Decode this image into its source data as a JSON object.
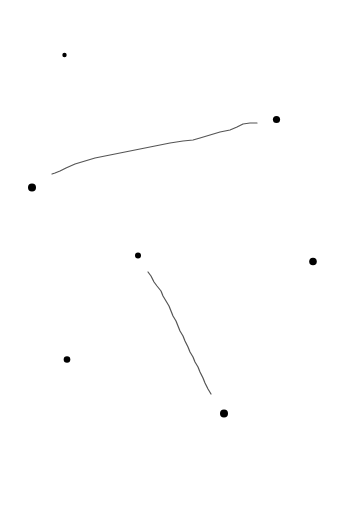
{
  "canvas": {
    "width": 337,
    "height": 524,
    "background": "#ffffff"
  },
  "points": [
    {
      "id": "dot-1",
      "x": 64.5,
      "y": 55,
      "r": 2.2,
      "color": "#000000"
    },
    {
      "id": "dot-2",
      "x": 276.5,
      "y": 119.5,
      "r": 3.6,
      "color": "#000000"
    },
    {
      "id": "dot-3",
      "x": 32,
      "y": 187.5,
      "r": 4.0,
      "color": "#000000"
    },
    {
      "id": "dot-4",
      "x": 138,
      "y": 255.5,
      "r": 3.0,
      "color": "#000000"
    },
    {
      "id": "dot-5",
      "x": 313,
      "y": 261.5,
      "r": 3.8,
      "color": "#000000"
    },
    {
      "id": "dot-6",
      "x": 67,
      "y": 359.5,
      "r": 3.3,
      "color": "#000000"
    },
    {
      "id": "dot-7",
      "x": 224,
      "y": 413.5,
      "r": 4.0,
      "color": "#000000"
    }
  ],
  "strokes": [
    {
      "id": "stroke-1",
      "color": "#555555",
      "width": 1.2,
      "points": [
        [
          52,
          174
        ],
        [
          55,
          173
        ],
        [
          60,
          171
        ],
        [
          66,
          168
        ],
        [
          75,
          164
        ],
        [
          85,
          161
        ],
        [
          95,
          158
        ],
        [
          110,
          155
        ],
        [
          125,
          152
        ],
        [
          140,
          149
        ],
        [
          155,
          146
        ],
        [
          170,
          143
        ],
        [
          183,
          141
        ],
        [
          193,
          140
        ],
        [
          200,
          138
        ],
        [
          210,
          135
        ],
        [
          220,
          132
        ],
        [
          230,
          130
        ],
        [
          237,
          127
        ],
        [
          243,
          124
        ],
        [
          250,
          123
        ],
        [
          257,
          123
        ]
      ]
    },
    {
      "id": "stroke-2",
      "color": "#555555",
      "width": 1.2,
      "points": [
        [
          148,
          272
        ],
        [
          151,
          276
        ],
        [
          154,
          282
        ],
        [
          157,
          286
        ],
        [
          161,
          291
        ],
        [
          163,
          296
        ],
        [
          166,
          301
        ],
        [
          169,
          306
        ],
        [
          171,
          311
        ],
        [
          173,
          316
        ],
        [
          176,
          321
        ],
        [
          178,
          326
        ],
        [
          180,
          331
        ],
        [
          183,
          336
        ],
        [
          185,
          341
        ],
        [
          188,
          347
        ],
        [
          190,
          352
        ],
        [
          193,
          357
        ],
        [
          195,
          362
        ],
        [
          198,
          367
        ],
        [
          200,
          372
        ],
        [
          203,
          378
        ],
        [
          205,
          383
        ],
        [
          208,
          389
        ],
        [
          211,
          394
        ]
      ]
    }
  ]
}
